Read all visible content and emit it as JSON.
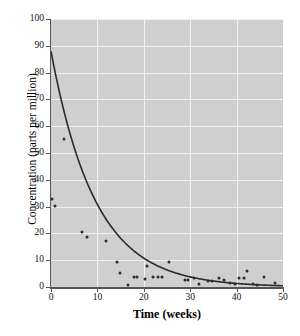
{
  "chart_data": {
    "type": "scatter",
    "title": "",
    "xlabel": "Time (weeks)",
    "ylabel": "Concentration (parts per million)",
    "xlim": [
      0,
      50
    ],
    "ylim": [
      0,
      100
    ],
    "xticks": [
      0,
      10,
      20,
      30,
      40,
      50
    ],
    "yticks": [
      0,
      10,
      20,
      30,
      40,
      50,
      60,
      70,
      80,
      90,
      100
    ],
    "grid": true,
    "legend": null,
    "series": [
      {
        "name": "observations",
        "type": "scatter",
        "marker": "circle",
        "color": "#2b2b2b",
        "points": [
          [
            0.2,
            32.8
          ],
          [
            0.9,
            30.2
          ],
          [
            2.8,
            55.3
          ],
          [
            6.6,
            20.4
          ],
          [
            7.8,
            18.8
          ],
          [
            11.9,
            17.0
          ],
          [
            14.3,
            9.4
          ],
          [
            14.9,
            5.4
          ],
          [
            16.7,
            0.6
          ],
          [
            17.8,
            3.8
          ],
          [
            18.6,
            3.8
          ],
          [
            20.2,
            2.9
          ],
          [
            20.6,
            7.9
          ],
          [
            22.0,
            3.8
          ],
          [
            23.0,
            3.8
          ],
          [
            24.0,
            3.9
          ],
          [
            25.5,
            9.2
          ],
          [
            28.8,
            2.6
          ],
          [
            29.6,
            2.6
          ],
          [
            30.9,
            3.5
          ],
          [
            31.9,
            1.2
          ],
          [
            33.9,
            2.3
          ],
          [
            34.8,
            2.2
          ],
          [
            36.2,
            3.4
          ],
          [
            37.2,
            2.6
          ],
          [
            38.6,
            1.5
          ],
          [
            39.6,
            1.2
          ],
          [
            40.6,
            3.2
          ],
          [
            41.5,
            3.3
          ],
          [
            42.3,
            6.0
          ],
          [
            43.5,
            1.0
          ],
          [
            44.4,
            0.6
          ],
          [
            45.9,
            3.6
          ],
          [
            48.3,
            1.4
          ]
        ]
      },
      {
        "name": "fitted exponential decay curve",
        "type": "line",
        "color": "#2b2b2b",
        "model": "C = 88 * e^(-0.105 * t)",
        "amplitude": 88,
        "rate": 0.105,
        "x_start": 0,
        "x_end": 50
      }
    ]
  }
}
